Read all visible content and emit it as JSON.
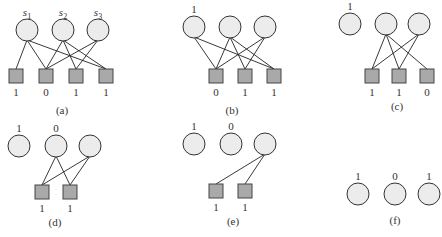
{
  "panels": [
    {
      "id": "a",
      "caption": "(a)",
      "circles": [
        {
          "label": "s1",
          "sub": true,
          "x": 27,
          "y": 30
        },
        {
          "label": "s2",
          "sub": true,
          "x": 63,
          "y": 30
        },
        {
          "label": "s3",
          "sub": true,
          "x": 98,
          "y": 30
        }
      ],
      "squares": [
        {
          "label": "1",
          "x": 16,
          "y": 76
        },
        {
          "label": "0",
          "x": 46,
          "y": 76
        },
        {
          "label": "1",
          "x": 76,
          "y": 76
        },
        {
          "label": "1",
          "x": 106,
          "y": 76
        }
      ],
      "edges": [
        [
          0,
          0
        ],
        [
          0,
          1
        ],
        [
          0,
          3
        ],
        [
          1,
          1
        ],
        [
          1,
          2
        ],
        [
          1,
          3
        ],
        [
          2,
          1
        ],
        [
          2,
          2
        ]
      ]
    },
    {
      "id": "b",
      "caption": "(b)",
      "circles": [
        {
          "label": "1",
          "x": 194,
          "y": 27
        },
        {
          "label": "",
          "x": 230,
          "y": 27
        },
        {
          "label": "",
          "x": 265,
          "y": 27
        }
      ],
      "squares": [
        {
          "label": "0",
          "x": 216,
          "y": 76
        },
        {
          "label": "1",
          "x": 245,
          "y": 76
        },
        {
          "label": "1",
          "x": 274,
          "y": 76
        }
      ],
      "edges": [
        [
          0,
          0
        ],
        [
          0,
          2
        ],
        [
          1,
          0
        ],
        [
          1,
          1
        ],
        [
          1,
          2
        ],
        [
          2,
          0
        ],
        [
          2,
          1
        ]
      ]
    },
    {
      "id": "c",
      "caption": "(c)",
      "circles": [
        {
          "label": "1",
          "x": 350,
          "y": 24
        },
        {
          "label": "",
          "x": 386,
          "y": 24
        },
        {
          "label": "",
          "x": 419,
          "y": 24
        }
      ],
      "squares": [
        {
          "label": "1",
          "x": 372,
          "y": 76
        },
        {
          "label": "1",
          "x": 399,
          "y": 76
        },
        {
          "label": "0",
          "x": 427,
          "y": 76
        }
      ],
      "edges": [
        [
          1,
          0
        ],
        [
          1,
          1
        ],
        [
          1,
          2
        ],
        [
          2,
          0
        ],
        [
          2,
          1
        ]
      ]
    },
    {
      "id": "d",
      "caption": "(d)",
      "circles": [
        {
          "label": "1",
          "x": 19,
          "y": 146
        },
        {
          "label": "0",
          "x": 56,
          "y": 146
        },
        {
          "label": "",
          "x": 90,
          "y": 146
        }
      ],
      "squares": [
        {
          "label": "1",
          "x": 42,
          "y": 192
        },
        {
          "label": "1",
          "x": 70,
          "y": 192
        }
      ],
      "edges": [
        [
          1,
          0
        ],
        [
          1,
          1
        ],
        [
          2,
          0
        ],
        [
          2,
          1
        ]
      ]
    },
    {
      "id": "e",
      "caption": "(e)",
      "circles": [
        {
          "label": "1",
          "x": 194,
          "y": 144
        },
        {
          "label": "0",
          "x": 231,
          "y": 144
        },
        {
          "label": "",
          "x": 265,
          "y": 144
        }
      ],
      "squares": [
        {
          "label": "1",
          "x": 216,
          "y": 191
        },
        {
          "label": "1",
          "x": 245,
          "y": 191
        }
      ],
      "edges": [
        [
          2,
          0
        ],
        [
          2,
          1
        ]
      ]
    },
    {
      "id": "f",
      "caption": "(f)",
      "circles": [
        {
          "label": "1",
          "x": 358,
          "y": 194
        },
        {
          "label": "0",
          "x": 395,
          "y": 194
        },
        {
          "label": "1",
          "x": 429,
          "y": 194
        }
      ],
      "squares": [],
      "edges": []
    }
  ],
  "captions": {
    "a": {
      "text": "(a)",
      "x": 62,
      "y": 114
    },
    "b": {
      "text": "(b)",
      "x": 232,
      "y": 114
    },
    "c": {
      "text": "(c)",
      "x": 397,
      "y": 110
    },
    "d": {
      "text": "(d)",
      "x": 55,
      "y": 226
    },
    "e": {
      "text": "(e)",
      "x": 233,
      "y": 225
    },
    "f": {
      "text": "(f)",
      "x": 395,
      "y": 224
    }
  },
  "style": {
    "circle_fill": "#ececec",
    "square_fill": "#a9a9a9",
    "stroke": "#333333"
  }
}
